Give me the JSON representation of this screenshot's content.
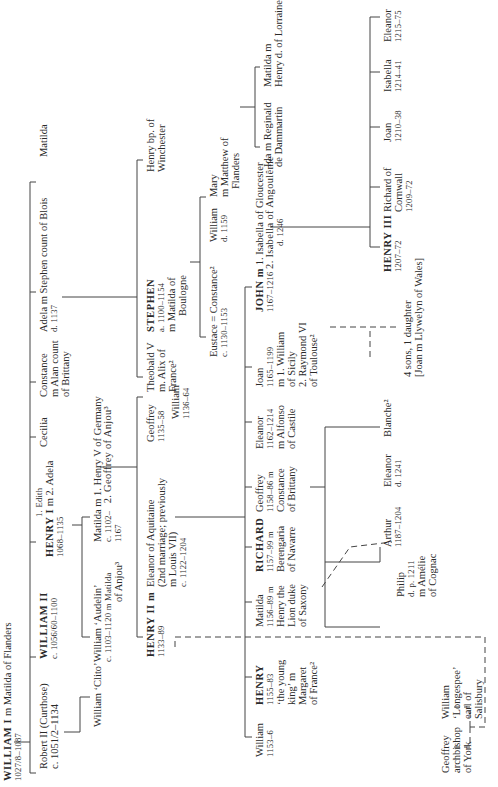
{
  "tree": {
    "william1": {
      "name": "WILLIAM I",
      "spouse": "m Matilda of Flanders",
      "dates": "1027/8–1087"
    },
    "robert2": {
      "name": "Robert II (Curthose)",
      "dates": "c. 1051/2–1134"
    },
    "william2": {
      "name": "WILLIAM II",
      "dates": "c. 1056/60–1100"
    },
    "henry1": {
      "name": "HENRY I",
      "spouse1": "1. Edith",
      "spouse2": "m 2. Adela",
      "dates": "1068–1135"
    },
    "cecilia": {
      "name": "Cecilia"
    },
    "constance": {
      "name": "Constance",
      "spouse": "m Alan count",
      "spouse2": "of Brittany"
    },
    "adela": {
      "name": "Adela m Stephen count of Blois",
      "dates": "d. 1137"
    },
    "matilda_top": {
      "name": "Matilda"
    },
    "william_clito": {
      "name": "William ‘Clito’"
    },
    "william_audelin": {
      "name": "William ‘Audelin’",
      "dates": "c. 1103–1120",
      "spouse": "m Matilda",
      "spouse2": "of Anjou³"
    },
    "matilda_empress": {
      "name": "Matilda m",
      "dates": "c. 1102–",
      "dates2": "1167",
      "spouse1": "1. Henry V of Germany",
      "spouse2": "2. Geoffrey of Anjou³"
    },
    "theobald": {
      "name": "Theobald V",
      "spouse": "m. Alix of",
      "spouse2": "France²"
    },
    "stephen": {
      "name": "STEPHEN",
      "dates": "a. 1100–1154",
      "spouse": "m Matilda of",
      "spouse2": "Boulogne"
    },
    "henry_bp": {
      "name": "Henry bp. of",
      "name2": "Winchester"
    },
    "henry2": {
      "name": "HENRY II m",
      "dates": "1133–89"
    },
    "eleanor_aq": {
      "name": "Eleanor of Aquitaine",
      "line2": "(2nd marriage; previously",
      "line3": "m Louis VII)",
      "dates": "c. 1122–1204"
    },
    "geoffrey_a": {
      "name": "Geoffrey",
      "dates": "1135–58"
    },
    "william_a": {
      "name": "William",
      "dates": "1136–64"
    },
    "eustace": {
      "name": "Eustace = Constance²",
      "dates": "c. 1130–1153"
    },
    "william_s": {
      "name": "William",
      "dates": "d. 1159"
    },
    "mary": {
      "name": "Mary",
      "spouse": "m Matthew of",
      "spouse2": "Flanders"
    },
    "ida": {
      "name": "Ida m Reginald",
      "name2": "de Dammartin"
    },
    "matilda_l": {
      "name": "Matilda m",
      "name2": "Henry d. of Lorraine"
    },
    "william_h": {
      "name": "William",
      "dates": "1153–6"
    },
    "henry_young": {
      "name": "HENRY",
      "dates": "1155–83",
      "l3": "‘the young",
      "l4": "king’ m",
      "l5": "Margaret",
      "l6": "of France²"
    },
    "matilda_s": {
      "name": "Matilda",
      "dates": "1156–89 m",
      "l3": "Henry the",
      "l4": "Lion duke",
      "l5": "of Saxony"
    },
    "richard": {
      "name": "RICHARD",
      "dates": "1157–99 m",
      "l3": "Berengaria",
      "l4": "of Navarre"
    },
    "geoffrey_b": {
      "name": "Geoffrey",
      "dates": "1158–86 m",
      "l3": "Constance",
      "l4": "of Brittany"
    },
    "eleanor_c": {
      "name": "Eleanor",
      "dates": "1162–1214",
      "l3": "m Alfonso",
      "l4": "of Castile"
    },
    "joan_s": {
      "name": "Joan",
      "dates": "1165–1199",
      "l3": "m 1. William",
      "l4": "of Sicily",
      "l5": "2. Raymond VI",
      "l6": "of Toulouse²"
    },
    "john": {
      "name": "JOHN m",
      "dates": "1167–1216",
      "spouse1": "1. Isabella of Gloucester",
      "spouse2": "2. Isabella of Angoulême",
      "spouse2_dates": "d. 1246"
    },
    "geoffrey_york": {
      "name": "Geoffrey",
      "l2": "archbishop",
      "l3": "of York"
    },
    "william_long": {
      "name": "William",
      "l2": "‘Longespee’",
      "l3": "earl of",
      "l4": "Salisbury"
    },
    "philip": {
      "name": "Philip",
      "dates": "d. p. 1211",
      "l3": "m Amélie",
      "l4": "of Cognac"
    },
    "arthur": {
      "name": "Arthur",
      "dates": "1187–1204"
    },
    "eleanor_b": {
      "name": "Eleanor",
      "dates": "d. 1241"
    },
    "blanche": {
      "name": "Blanche²"
    },
    "john_illeg": {
      "line1": "4 sons, 1 daughter",
      "line2": "[Joan m Llywelyn of Wales]"
    },
    "henry3": {
      "name": "HENRY III",
      "dates": "1207–72"
    },
    "richard_c": {
      "name": "Richard of",
      "name2": "Cornwall",
      "dates": "1209–72"
    },
    "joan_j": {
      "name": "Joan",
      "dates": "1210–38"
    },
    "isabella_j": {
      "name": "Isabella",
      "dates": "1214–41"
    },
    "eleanor_j": {
      "name": "Eleanor",
      "dates": "1215–75"
    }
  }
}
